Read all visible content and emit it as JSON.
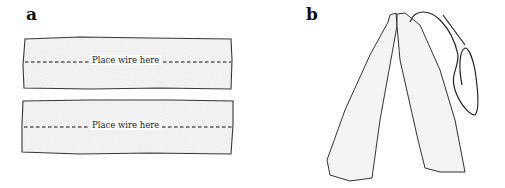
{
  "panels": [
    {
      "label": "a",
      "strips": [
        {
          "text": "Place wire here"
        },
        {
          "text": "Place wire here"
        }
      ]
    },
    {
      "label": "b"
    }
  ],
  "colors": {
    "outline": "#333333",
    "fill": "#f4f4f4",
    "dash": "#111111"
  }
}
